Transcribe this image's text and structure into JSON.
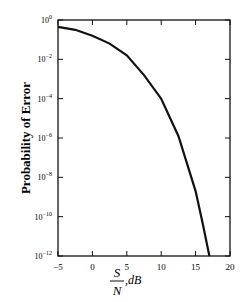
{
  "chart_data": {
    "type": "line",
    "title": "",
    "xlabel_num": "S",
    "xlabel_den": "N",
    "xlabel_unit": ",dB",
    "ylabel": "Probability of Error",
    "xlim": [
      -5,
      20
    ],
    "ylim_exponent": [
      -12,
      0
    ],
    "yscale": "log",
    "grid": false,
    "x_ticks": [
      "-5",
      "0",
      "5",
      "10",
      "15",
      "20"
    ],
    "y_ticks": [
      {
        "base": "10",
        "exp": "0"
      },
      {
        "base": "10",
        "exp": "-2"
      },
      {
        "base": "10",
        "exp": "-4"
      },
      {
        "base": "10",
        "exp": "-6"
      },
      {
        "base": "10",
        "exp": "-8"
      },
      {
        "base": "10",
        "exp": "-10"
      },
      {
        "base": "10",
        "exp": "-12"
      }
    ],
    "series": [
      {
        "name": "Probability of Error",
        "x": [
          -5,
          -2.5,
          0,
          2.5,
          5,
          7.5,
          10,
          12.5,
          15,
          16,
          17
        ],
        "log10_y": [
          -0.35,
          -0.5,
          -0.8,
          -1.2,
          -1.8,
          -2.8,
          -4.0,
          -5.9,
          -8.7,
          -10.3,
          -12
        ]
      }
    ]
  }
}
